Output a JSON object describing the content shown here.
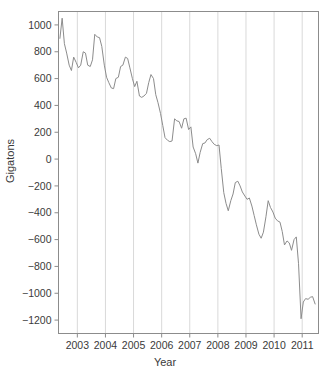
{
  "chart_data": {
    "type": "line",
    "title": "",
    "xlabel": "Year",
    "ylabel": "Gigatons",
    "xlim": [
      2002.33,
      2011.58
    ],
    "ylim": [
      -1300,
      1100
    ],
    "grid": "vertical",
    "legend": "none",
    "line_color": "#8c8c8c",
    "frame_color": "#8c8c8c",
    "gridline_color": "#d9d9d9",
    "background": "#ffffff",
    "xticks": [
      "2003",
      "2004",
      "2005",
      "2006",
      "2007",
      "2008",
      "2009",
      "2010",
      "2011"
    ],
    "xtick_values": [
      2003,
      2004,
      2005,
      2006,
      2007,
      2008,
      2009,
      2010,
      2011
    ],
    "yticks": [
      "1000",
      "800",
      "600",
      "400",
      "200",
      "0",
      "-200",
      "-400",
      "-600",
      "-800",
      "-1000",
      "-1200"
    ],
    "ytick_values": [
      1000,
      800,
      600,
      400,
      200,
      0,
      -200,
      -400,
      -600,
      -800,
      -1000,
      -1200
    ],
    "series": [
      {
        "name": "Ice mass anomaly",
        "x": [
          2002.38,
          2002.46,
          2002.54,
          2002.62,
          2002.71,
          2002.79,
          2002.87,
          2002.96,
          2003.04,
          2003.12,
          2003.21,
          2003.29,
          2003.37,
          2003.46,
          2003.54,
          2003.62,
          2003.71,
          2003.79,
          2003.87,
          2003.96,
          2004.04,
          2004.12,
          2004.21,
          2004.29,
          2004.37,
          2004.46,
          2004.54,
          2004.62,
          2004.71,
          2004.79,
          2004.87,
          2004.96,
          2005.04,
          2005.12,
          2005.21,
          2005.29,
          2005.37,
          2005.46,
          2005.54,
          2005.62,
          2005.71,
          2005.79,
          2005.87,
          2005.96,
          2006.04,
          2006.12,
          2006.21,
          2006.29,
          2006.37,
          2006.46,
          2006.54,
          2006.62,
          2006.71,
          2006.79,
          2006.87,
          2006.96,
          2007.04,
          2007.12,
          2007.21,
          2007.29,
          2007.37,
          2007.46,
          2007.54,
          2007.62,
          2007.71,
          2007.79,
          2007.87,
          2007.96,
          2008.04,
          2008.12,
          2008.21,
          2008.29,
          2008.37,
          2008.46,
          2008.54,
          2008.62,
          2008.71,
          2008.79,
          2008.87,
          2008.96,
          2009.04,
          2009.12,
          2009.21,
          2009.29,
          2009.37,
          2009.46,
          2009.54,
          2009.62,
          2009.71,
          2009.79,
          2009.87,
          2009.96,
          2010.04,
          2010.12,
          2010.21,
          2010.29,
          2010.37,
          2010.46,
          2010.54,
          2010.62,
          2010.71,
          2010.79,
          2010.87,
          2010.96,
          2011.04,
          2011.12,
          2011.21,
          2011.29,
          2011.37,
          2011.46
        ],
        "values": [
          900,
          1050,
          860,
          790,
          700,
          660,
          760,
          720,
          680,
          700,
          800,
          790,
          700,
          690,
          740,
          930,
          910,
          905,
          840,
          700,
          610,
          570,
          530,
          525,
          600,
          610,
          690,
          700,
          760,
          750,
          680,
          600,
          540,
          580,
          470,
          460,
          470,
          490,
          570,
          630,
          600,
          480,
          420,
          340,
          250,
          160,
          140,
          130,
          135,
          300,
          285,
          280,
          230,
          300,
          305,
          220,
          240,
          90,
          40,
          -30,
          50,
          115,
          120,
          145,
          155,
          130,
          110,
          100,
          105,
          -70,
          -250,
          -330,
          -385,
          -310,
          -260,
          -175,
          -165,
          -200,
          -245,
          -275,
          -300,
          -290,
          -350,
          -420,
          -490,
          -560,
          -590,
          -545,
          -430,
          -310,
          -360,
          -395,
          -440,
          -460,
          -470,
          -540,
          -640,
          -610,
          -625,
          -680,
          -600,
          -580,
          -780,
          -1190,
          -1065,
          -1040,
          -1045,
          -1030,
          -1025,
          -1080
        ]
      }
    ]
  },
  "axis": {
    "x_title": "Year",
    "y_title": "Gigatons"
  }
}
